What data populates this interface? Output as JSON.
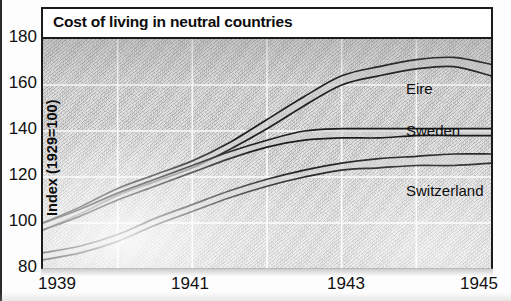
{
  "chart_data": {
    "type": "line",
    "title": "Cost of living in neutral countries",
    "xlabel": "",
    "ylabel": "Index (1929=100)",
    "xlim": [
      1939,
      1945
    ],
    "ylim": [
      80,
      180
    ],
    "yticks": [
      180,
      160,
      140,
      120,
      100,
      80
    ],
    "xticks": [
      1939,
      1941,
      1943,
      1945
    ],
    "grid": true,
    "grid_color": "#ffffff",
    "background": "#e2e2e2",
    "line_color": "#1a1a1a",
    "legend": "inline-labels",
    "legend_position": "right-inside",
    "note": "Each country is drawn as a narrow band bounded by two nearly-parallel lines.",
    "x": [
      1939,
      1939.5,
      1940,
      1940.5,
      1941,
      1941.5,
      1942,
      1942.5,
      1943,
      1943.5,
      1944,
      1944.5,
      1945
    ],
    "series": [
      {
        "name": "Eire",
        "values": [
          97,
          104,
          112,
          118,
          124,
          132,
          141,
          151,
          160,
          165,
          169,
          171,
          168
        ],
        "values_upper": [
          100,
          107,
          115,
          121,
          127,
          135,
          145,
          155,
          164,
          168,
          171,
          172,
          169
        ],
        "values_lower": [
          97,
          104,
          112,
          118,
          124,
          132,
          141,
          151,
          160,
          164,
          167,
          168,
          164
        ]
      },
      {
        "name": "Sweden",
        "values": [
          100,
          106,
          113,
          119,
          124,
          130,
          135,
          139,
          140,
          140,
          140,
          141,
          141
        ],
        "values_upper": [
          100,
          106,
          113,
          119,
          125,
          131,
          136,
          140,
          141,
          141,
          141,
          141,
          141
        ],
        "values_lower": [
          97,
          103,
          110,
          116,
          122,
          128,
          133,
          136,
          137,
          137,
          138,
          138,
          138
        ]
      },
      {
        "name": "Switzerland",
        "values": [
          86,
          89,
          94,
          101,
          107,
          113,
          118,
          122,
          125,
          127,
          128,
          129,
          130
        ],
        "values_upper": [
          87,
          90,
          95,
          102,
          108,
          114,
          119,
          123,
          126,
          128,
          129,
          130,
          130
        ],
        "values_lower": [
          84,
          87,
          92,
          99,
          105,
          111,
          116,
          120,
          123,
          124,
          125,
          125,
          126
        ]
      }
    ],
    "series_labels": [
      {
        "name": "Eire",
        "x_px": 404,
        "y_px": 76
      },
      {
        "name": "Sweden",
        "x_px": 404,
        "y_px": 118
      },
      {
        "name": "Switzerland",
        "x_px": 404,
        "y_px": 178
      }
    ]
  },
  "axes": {
    "y_tick_labels": [
      "180",
      "160",
      "140",
      "120",
      "100",
      "80"
    ],
    "x_tick_labels": [
      "1939",
      "1941",
      "1943",
      "1945"
    ],
    "y_axis_title": "Index (1929=100)"
  },
  "title": {
    "text": "Cost of living in neutral countries"
  }
}
